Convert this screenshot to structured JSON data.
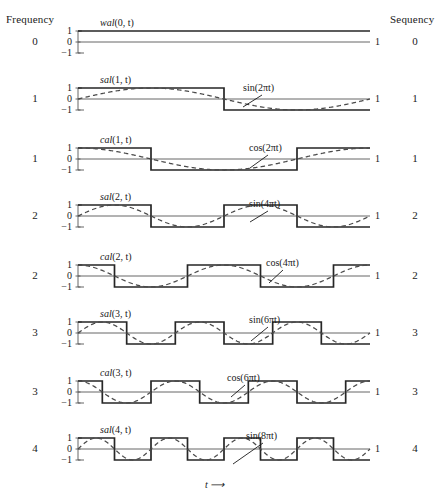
{
  "figure": {
    "title_left": "Frequency",
    "title_right": "Sequency",
    "x_axis_label": "t ⟶",
    "y_ticks": [
      "1",
      "0",
      "−1"
    ],
    "x_end_tick": "1",
    "colors": {
      "walsh": "#262626",
      "sine": "#4a4a4a",
      "axis": "#555555",
      "text": "#1a1a1a"
    }
  },
  "panels": [
    {
      "frequency": "0",
      "sequency": "0",
      "walsh_label_fn": "wal",
      "walsh_label_args": "(0, t)",
      "sine_label": "",
      "end_tick": "1",
      "y_ticks": [
        "1",
        "0",
        "−1"
      ]
    },
    {
      "frequency": "1",
      "sequency": "1",
      "walsh_label_fn": "sal",
      "walsh_label_args": "(1, t)",
      "sine_label": "sin(2πt)",
      "end_tick": "1",
      "y_ticks": [
        "1",
        "0",
        "−1"
      ]
    },
    {
      "frequency": "1",
      "sequency": "1",
      "walsh_label_fn": "cal",
      "walsh_label_args": "(1, t)",
      "sine_label": "cos(2πt)",
      "end_tick": "1",
      "y_ticks": [
        "1",
        "0",
        "−1"
      ]
    },
    {
      "frequency": "2",
      "sequency": "2",
      "walsh_label_fn": "sal",
      "walsh_label_args": "(2, t)",
      "sine_label": "sin(4πt)",
      "end_tick": "1",
      "y_ticks": [
        "1",
        "0",
        "−1"
      ]
    },
    {
      "frequency": "2",
      "sequency": "2",
      "walsh_label_fn": "cal",
      "walsh_label_args": "(2, t)",
      "sine_label": "cos(4πt)",
      "end_tick": "1",
      "y_ticks": [
        "1",
        "0",
        "−1"
      ]
    },
    {
      "frequency": "3",
      "sequency": "3",
      "walsh_label_fn": "sal",
      "walsh_label_args": "(3, t)",
      "sine_label": "sin(6πt)",
      "end_tick": "1",
      "y_ticks": [
        "1",
        "0",
        "−1"
      ]
    },
    {
      "frequency": "3",
      "sequency": "3",
      "walsh_label_fn": "cal",
      "walsh_label_args": "(3, t)",
      "sine_label": "cos(6πt)",
      "end_tick": "1",
      "y_ticks": [
        "1",
        "0",
        "−1"
      ]
    },
    {
      "frequency": "4",
      "sequency": "4",
      "walsh_label_fn": "sal",
      "walsh_label_args": "(4, t)",
      "sine_label": "sin(8πt)",
      "end_tick": "1",
      "y_ticks": [
        "1",
        "0",
        "−1"
      ]
    }
  ],
  "chart_data": {
    "type": "line",
    "xlabel": "t ⟶",
    "ylabel": "",
    "xlim": [
      0,
      1
    ],
    "ylim": [
      -1,
      1
    ],
    "grid": false,
    "legend": "none",
    "x_ticks": [
      1
    ],
    "y_ticks": [
      -1,
      0,
      1
    ],
    "subplots": [
      {
        "index": 0,
        "frequency": 0,
        "sequency": 0,
        "series": [
          {
            "name": "wal(0, t)",
            "style": "solid-square",
            "description": "Constant value +1 over 0 ≤ t < 1",
            "transitions": [],
            "start_value": 1
          }
        ]
      },
      {
        "index": 1,
        "frequency": 1,
        "sequency": 1,
        "series": [
          {
            "name": "sal(1, t)",
            "style": "solid-square",
            "description": "+1 on [0,0.5), −1 on [0.5,1)",
            "transitions": [
              0.5
            ],
            "start_value": 1
          },
          {
            "name": "sin(2πt)",
            "style": "dashed-sine",
            "amplitude": 1,
            "cycles": 1,
            "phase": "sin"
          }
        ]
      },
      {
        "index": 2,
        "frequency": 1,
        "sequency": 1,
        "series": [
          {
            "name": "cal(1, t)",
            "style": "solid-square",
            "description": "+1 on [0,0.25), −1 on [0.25,0.75), +1 on [0.75,1)",
            "transitions": [
              0.25,
              0.75
            ],
            "start_value": 1
          },
          {
            "name": "cos(2πt)",
            "style": "dashed-sine",
            "amplitude": 1,
            "cycles": 1,
            "phase": "cos"
          }
        ]
      },
      {
        "index": 3,
        "frequency": 2,
        "sequency": 2,
        "series": [
          {
            "name": "sal(2, t)",
            "style": "solid-square",
            "description": "+1,−1,+1,−1 on quarters",
            "transitions": [
              0.25,
              0.5,
              0.75
            ],
            "start_value": 1
          },
          {
            "name": "sin(4πt)",
            "style": "dashed-sine",
            "amplitude": 1,
            "cycles": 2,
            "phase": "sin"
          }
        ]
      },
      {
        "index": 4,
        "frequency": 2,
        "sequency": 2,
        "series": [
          {
            "name": "cal(2, t)",
            "style": "solid-square",
            "description": "+1,−1,+1,−1,+1 with eighth-period offset",
            "transitions": [
              0.125,
              0.375,
              0.625,
              0.875
            ],
            "start_value": 1
          },
          {
            "name": "cos(4πt)",
            "style": "dashed-sine",
            "amplitude": 1,
            "cycles": 2,
            "phase": "cos"
          }
        ]
      },
      {
        "index": 5,
        "frequency": 3,
        "sequency": 3,
        "series": [
          {
            "name": "sal(3, t)",
            "style": "solid-square",
            "description": "six-level alternation matching sin(6πt) sign",
            "transitions": [
              0.1667,
              0.3333,
              0.5,
              0.6667,
              0.8333
            ],
            "start_value": 1
          },
          {
            "name": "sin(6πt)",
            "style": "dashed-sine",
            "amplitude": 1,
            "cycles": 3,
            "phase": "sin"
          }
        ]
      },
      {
        "index": 6,
        "frequency": 3,
        "sequency": 3,
        "series": [
          {
            "name": "cal(3, t)",
            "style": "solid-square",
            "description": "alternation matching cos(6πt) sign",
            "transitions": [
              0.0833,
              0.25,
              0.4167,
              0.5833,
              0.75,
              0.9167
            ],
            "start_value": 1
          },
          {
            "name": "cos(6πt)",
            "style": "dashed-sine",
            "amplitude": 1,
            "cycles": 3,
            "phase": "cos"
          }
        ]
      },
      {
        "index": 7,
        "frequency": 4,
        "sequency": 4,
        "series": [
          {
            "name": "sal(4, t)",
            "style": "solid-square",
            "description": "eight-level alternation matching sin(8πt) sign",
            "transitions": [
              0.125,
              0.25,
              0.375,
              0.5,
              0.625,
              0.75,
              0.875
            ],
            "start_value": 1
          },
          {
            "name": "sin(8πt)",
            "style": "dashed-sine",
            "amplitude": 1,
            "cycles": 4,
            "phase": "sin"
          }
        ]
      }
    ]
  }
}
